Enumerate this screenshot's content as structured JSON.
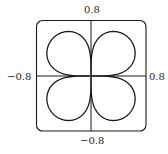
{
  "chart_data": {
    "type": "line",
    "title": "",
    "xlabel": "",
    "ylabel": "",
    "xlim": [
      -0.8,
      0.8
    ],
    "ylim": [
      -0.8,
      0.8
    ],
    "grid": false,
    "axes_through_origin": true,
    "tick_labels": {
      "top": "0.8",
      "bottom": "−0.8",
      "left": "−0.8",
      "right": "0.8"
    },
    "curve": {
      "form": "polar",
      "equation": "r = a·|sin(2θ)|^k",
      "a": 0.78,
      "k": 0.35,
      "theta_range": [
        0,
        6.2832
      ],
      "petals": 4
    },
    "series": [
      {
        "name": "rose curve",
        "color": "#1a1a1a"
      }
    ]
  },
  "frame": {
    "stroke": "#1a1a1a",
    "corner_radius_px": 6
  }
}
